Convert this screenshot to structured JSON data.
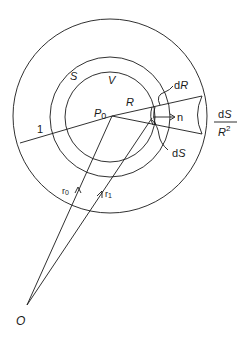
{
  "figure": {
    "labels": {
      "S": "S",
      "V": "V",
      "R": "R",
      "P0_main": "P",
      "P0_sub": "0",
      "one": "1",
      "dR_d": "d",
      "dR_R": "R",
      "n": "n",
      "dS_d": "d",
      "dS_S": "S",
      "frac_num_d": "d",
      "frac_num_S": "S",
      "frac_den_R": "R",
      "frac_den_exp": "2",
      "r0_main": "r",
      "r0_sub": "0",
      "r1_main": "r",
      "r1_sub": "1",
      "O": "O"
    },
    "circles": [
      {
        "name": "unit-sphere",
        "cx": 110,
        "cy": 116,
        "r": 97
      },
      {
        "name": "surface-S",
        "cx": 110,
        "cy": 117,
        "r": 60
      },
      {
        "name": "volume-V",
        "cx": 110,
        "cy": 117,
        "r": 45
      }
    ],
    "stroke_color": "#1a1a1a",
    "background": "#ffffff"
  }
}
